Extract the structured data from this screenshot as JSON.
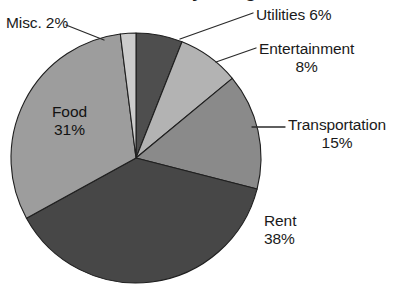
{
  "chart_data": {
    "type": "pie",
    "title": "Monthly Budget",
    "xlabel": "",
    "ylabel": "",
    "legend_position": "none",
    "grid": false,
    "units": "percent",
    "categories": [
      "Utilities",
      "Entertainment",
      "Transportation",
      "Rent",
      "Food",
      "Misc."
    ],
    "values": [
      6,
      8,
      15,
      38,
      31,
      2
    ],
    "start_angle_deg": 0,
    "direction": "clockwise",
    "slices": [
      {
        "label": "Utilities",
        "value": 6,
        "value_text": "6%",
        "label_text": "Utilities 6%",
        "color": "#4e4e4e",
        "label_placement": "outside",
        "has_leader_line": true
      },
      {
        "label": "Entertainment",
        "value": 8,
        "value_text": "8%",
        "label_text": "Entertainment 8%",
        "color": "#b3b3b3",
        "label_placement": "outside",
        "has_leader_line": true
      },
      {
        "label": "Transportation",
        "value": 15,
        "value_text": "15%",
        "label_text": "Transportation 15%",
        "color": "#8a8a8a",
        "label_placement": "outside",
        "has_leader_line": true
      },
      {
        "label": "Rent",
        "value": 38,
        "value_text": "38%",
        "label_text": "Rent 38%",
        "color": "#474747",
        "label_placement": "outside",
        "has_leader_line": false
      },
      {
        "label": "Food",
        "value": 31,
        "value_text": "31%",
        "label_text": "Food 31%",
        "color": "#9d9d9d",
        "label_placement": "inside",
        "has_leader_line": false
      },
      {
        "label": "Misc.",
        "value": 2,
        "value_text": "2%",
        "label_text": "Misc. 2%",
        "color": "#cccccc",
        "label_placement": "outside",
        "has_leader_line": true
      }
    ]
  },
  "labels": {
    "misc": {
      "name": "Misc.",
      "value": "2%",
      "combined": "Misc. 2%"
    },
    "utilities": {
      "name": "Utilities",
      "value": "6%",
      "combined": "Utilities 6%"
    },
    "entertainment": {
      "name": "Entertainment",
      "value": "8%"
    },
    "transportation": {
      "name": "Transportation",
      "value": "15%"
    },
    "rent": {
      "name": "Rent",
      "value": "38%"
    },
    "food": {
      "name": "Food",
      "value": "31%"
    }
  },
  "geometry": {
    "center_x": 136,
    "center_y": 158,
    "radius": 125
  },
  "colors": {
    "background": "#ffffff",
    "outline": "#1f1f1f",
    "text": "#1a1a1a",
    "leader_line": "#2b2b2b"
  }
}
